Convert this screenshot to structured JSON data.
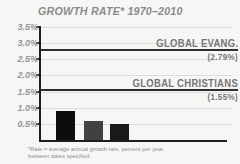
{
  "title": "GROWTH RATE* 1970–2010",
  "footnote": {
    "line1": "*Rate = average annual growth rate, percent per year,",
    "line2": "between dates specified."
  },
  "colors": {
    "background": "#f6f6f5",
    "axis": "#1e1e1e",
    "gridline": "#dcdcdc",
    "title_text": "#8b8b8b",
    "tick_text": "#979797",
    "annotation_text": "#767676",
    "footnote_text": "#8d8d8d"
  },
  "chart_data": {
    "type": "bar",
    "title": "GROWTH RATE* 1970–2010",
    "categories": [
      "",
      "",
      ""
    ],
    "values": [
      0.9,
      0.6,
      0.5
    ],
    "bar_colors": [
      "#0c0c0c",
      "#414141",
      "#191919"
    ],
    "xlabel": "",
    "ylabel": "",
    "ylim": [
      0,
      3.5
    ],
    "yticks": [
      3.5,
      3.0,
      2.5,
      2.0,
      1.5,
      1.0,
      0.5
    ],
    "ytick_labels": [
      "3.5%",
      "3.0%",
      "2.5%",
      "2.0%",
      "1.5%",
      "1.0%",
      "0.5%"
    ],
    "grid": true,
    "legend": "none",
    "reference_lines": [
      {
        "value": 2.79,
        "label": "GLOBAL EVANG.",
        "value_label": "(2.79%)"
      },
      {
        "value": 1.55,
        "label": "GLOBAL CHRISTIANS",
        "value_label": "(1.55%)"
      }
    ]
  }
}
